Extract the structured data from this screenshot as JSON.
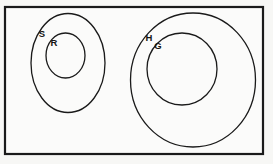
{
  "figure": {
    "kind": "euler-diagram",
    "background_color": "#f7f7f5",
    "ink_color": "#1a1a1a",
    "frame": {
      "name": "diagram-frame",
      "x": 5,
      "y": 7,
      "width": 258,
      "height": 147,
      "stroke_width": 2.2,
      "fill": "#fbfbfa"
    }
  },
  "groups": [
    {
      "id": "left-group",
      "outer": {
        "label": "S",
        "cx": 68,
        "cy": 63,
        "rx": 37,
        "ry": 49.5,
        "stroke_width": 1.3,
        "label_x": 42,
        "label_y": 37,
        "label_size": 9.5
      },
      "inner": {
        "label": "R",
        "cx": 65.5,
        "cy": 55.5,
        "rx": 19.5,
        "ry": 22.5,
        "stroke_width": 1.3,
        "label_x": 54,
        "label_y": 46,
        "label_size": 9.5
      }
    },
    {
      "id": "right-group",
      "outer": {
        "label": "H",
        "cx": 193,
        "cy": 80,
        "rx": 62.5,
        "ry": 67,
        "stroke_width": 1.3,
        "label_x": 149,
        "label_y": 41,
        "label_size": 9.5
      },
      "inner": {
        "label": "G",
        "cx": 182,
        "cy": 69,
        "rx": 35,
        "ry": 36,
        "stroke_width": 1.3,
        "label_x": 158,
        "label_y": 49,
        "label_size": 9.5
      }
    }
  ]
}
